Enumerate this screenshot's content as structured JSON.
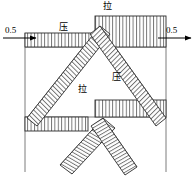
{
  "figure": {
    "type": "structural-stress-diagram",
    "width": 194,
    "height": 177,
    "background_color": "#ffffff",
    "line_color": "#000000",
    "hatch_color": "#555555"
  },
  "loads": {
    "left": {
      "value": "0.5",
      "direction": "right",
      "arrow": "arrow-right-icon"
    },
    "right": {
      "value": "0.5",
      "direction": "right",
      "arrow": "arrow-right-icon"
    }
  },
  "labels": {
    "la_top": "拉",
    "ya_top": "压",
    "la_mid": "拉",
    "ya_mid": "压"
  },
  "legend_meaning": {
    "拉": "tension",
    "压": "compression"
  }
}
